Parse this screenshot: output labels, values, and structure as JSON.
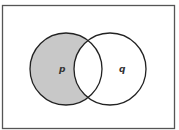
{
  "diagram": {
    "type": "venn",
    "universe": {
      "x": 2.5,
      "y": 5.5,
      "width": 172,
      "height": 123,
      "stroke": "#555555"
    },
    "sets": [
      {
        "id": "p",
        "label": "p",
        "cx": 66,
        "cy": 69,
        "r": 36,
        "label_x": 59,
        "label_y": 72
      },
      {
        "id": "q",
        "label": "q",
        "cx": 110,
        "cy": 69,
        "r": 36,
        "label_x": 119,
        "label_y": 72
      }
    ],
    "shaded_region": "p minus q",
    "shade_color": "#c8c8c8",
    "stroke_color": "#222222"
  }
}
